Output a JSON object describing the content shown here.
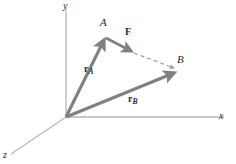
{
  "figure": {
    "width": 236,
    "height": 164,
    "background": "#ffffff",
    "colors": {
      "axis": "#b0b0b0",
      "vector": "#808080",
      "dashed": "#9a9a9a",
      "text": "#2b2b2b"
    }
  },
  "axes": {
    "origin": {
      "x": 66,
      "y": 117
    },
    "items": [
      {
        "name": "y-axis",
        "label": "y",
        "label_x": 63,
        "label_y": 1,
        "x1": 66,
        "y1": 8,
        "x2": 66,
        "y2": 117
      },
      {
        "name": "x-axis",
        "label": "x",
        "label_x": 219,
        "label_y": 111,
        "x1": 66,
        "y1": 117,
        "x2": 224,
        "y2": 117
      },
      {
        "name": "z-axis",
        "label": "z",
        "label_x": 3,
        "label_y": 150,
        "x1": 66,
        "y1": 117,
        "x2": 11,
        "y2": 154
      }
    ]
  },
  "vectors": [
    {
      "name": "r-a-vector",
      "label": "r",
      "subscript": "A",
      "label_x": 84,
      "label_y": 64,
      "x1": 66,
      "y1": 117,
      "x2": 105,
      "y2": 37,
      "width": 3.1
    },
    {
      "name": "r-b-vector",
      "label": "r",
      "subscript": "B",
      "label_x": 128,
      "label_y": 94,
      "x1": 66,
      "y1": 117,
      "x2": 177,
      "y2": 72,
      "width": 3.1
    },
    {
      "name": "force-vector",
      "label": "F",
      "subscript": "",
      "label_x": 125,
      "label_y": 27,
      "x1": 106,
      "y1": 38,
      "x2": 134,
      "y2": 53,
      "width": 2.8
    }
  ],
  "dashed_line": {
    "name": "line-of-action",
    "x1": 133,
    "y1": 52,
    "x2": 177,
    "y2": 69,
    "dash": "4,3"
  },
  "points": [
    {
      "name": "point-a",
      "label": "A",
      "label_x": 100,
      "label_y": 17,
      "x": 105,
      "y": 37
    },
    {
      "name": "point-b",
      "label": "B",
      "label_x": 177,
      "label_y": 54,
      "x": 177,
      "y": 71
    }
  ]
}
